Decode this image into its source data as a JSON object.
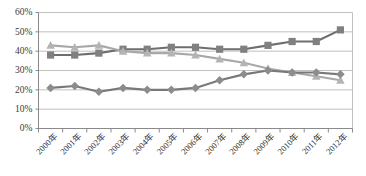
{
  "chart_data": {
    "type": "line",
    "title": "",
    "subtitle": "",
    "xlabel": "",
    "ylabel": "",
    "ylim": [
      0,
      60
    ],
    "y_tick_step": 10,
    "y_tick_labels": [
      "0%",
      "10%",
      "20%",
      "30%",
      "40%",
      "50%",
      "60%"
    ],
    "y_tick_values": [
      0,
      10,
      20,
      30,
      40,
      50,
      60
    ],
    "grid": true,
    "legend_position": "none",
    "categories": [
      "2000年",
      "2001年",
      "2002年",
      "2003年",
      "2004年",
      "2005年",
      "2006年",
      "2007年",
      "2008年",
      "2009年",
      "2010年",
      "2011年",
      "2012年"
    ],
    "series": [
      {
        "name": "series-square",
        "marker": "square",
        "color": "#808080",
        "line_color": "#6e6e6e",
        "values": [
          38,
          38,
          39,
          41,
          41,
          42,
          42,
          41,
          41,
          43,
          45,
          45,
          51
        ]
      },
      {
        "name": "series-triangle",
        "marker": "triangle",
        "color": "#b4b4b4",
        "line_color": "#a8a8a8",
        "values": [
          43,
          42,
          43,
          40,
          39,
          39,
          38,
          36,
          34,
          31,
          29,
          27,
          25
        ]
      },
      {
        "name": "series-diamond",
        "marker": "diamond",
        "color": "#8c8c8c",
        "line_color": "#787878",
        "values": [
          21,
          22,
          19,
          21,
          20,
          20,
          21,
          25,
          28,
          30,
          29,
          29,
          28
        ]
      }
    ]
  },
  "colors": {
    "background": "#ffffff",
    "gridline": "#b9b9b9",
    "axis": "#8a8a8a",
    "tick_text": "#2e2e2e",
    "series_square": "#808080",
    "series_triangle": "#b4b4b4",
    "series_diamond": "#8c8c8c"
  }
}
